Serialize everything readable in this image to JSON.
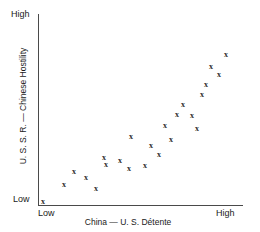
{
  "chart_data": {
    "type": "scatter",
    "title": "",
    "xlabel": "China — U. S. Détente",
    "ylabel": "U. S. S. R. — Chinese Hostility",
    "xlim": [
      0,
      100
    ],
    "ylim": [
      0,
      100
    ],
    "x_tick_labels": [
      "Low",
      "High"
    ],
    "y_tick_labels": [
      "Low",
      "High"
    ],
    "grid": false,
    "legend": null,
    "marker": "x",
    "marker_color": "#2b2b2b",
    "axis_color": "#4a4a4a",
    "n_points": 24,
    "points": [
      {
        "x": 2.4,
        "y": 1.6
      },
      {
        "x": 12.7,
        "y": 10.9
      },
      {
        "x": 17.6,
        "y": 17.7
      },
      {
        "x": 23.4,
        "y": 14.6
      },
      {
        "x": 28.3,
        "y": 8.9
      },
      {
        "x": 32.2,
        "y": 25.0
      },
      {
        "x": 33.2,
        "y": 21.4
      },
      {
        "x": 40.0,
        "y": 23.4
      },
      {
        "x": 44.4,
        "y": 19.3
      },
      {
        "x": 45.4,
        "y": 35.9
      },
      {
        "x": 52.2,
        "y": 20.8
      },
      {
        "x": 55.1,
        "y": 31.3
      },
      {
        "x": 59.0,
        "y": 26.6
      },
      {
        "x": 62.0,
        "y": 41.7
      },
      {
        "x": 64.9,
        "y": 34.4
      },
      {
        "x": 67.8,
        "y": 47.4
      },
      {
        "x": 70.7,
        "y": 52.6
      },
      {
        "x": 75.1,
        "y": 46.9
      },
      {
        "x": 77.6,
        "y": 40.1
      },
      {
        "x": 80.0,
        "y": 57.8
      },
      {
        "x": 82.0,
        "y": 63.0
      },
      {
        "x": 84.4,
        "y": 72.4
      },
      {
        "x": 88.3,
        "y": 68.2
      },
      {
        "x": 91.7,
        "y": 78.6
      }
    ]
  },
  "axes": {
    "y": {
      "title": "U. S. S. R. — Chinese Hostility",
      "high_label": "High",
      "low_label": "Low"
    },
    "x": {
      "title": "China — U. S. Détente",
      "high_label": "High",
      "low_label": "Low"
    }
  }
}
